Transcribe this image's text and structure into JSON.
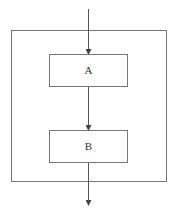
{
  "diagram": {
    "type": "flowchart",
    "outer_box": {
      "label": ""
    },
    "nodes": [
      {
        "id": "A",
        "label": "A"
      },
      {
        "id": "B",
        "label": "B"
      }
    ],
    "edges": [
      {
        "from": "entry",
        "to": "A"
      },
      {
        "from": "A",
        "to": "B"
      },
      {
        "from": "B",
        "to": "exit"
      }
    ],
    "colors": {
      "stroke": "#555555",
      "text": "#333333",
      "background": "#ffffff"
    }
  }
}
